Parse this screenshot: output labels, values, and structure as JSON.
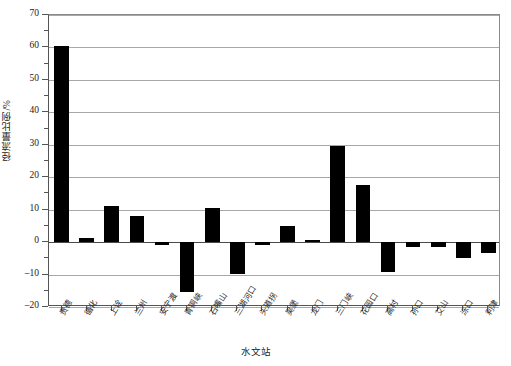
{
  "chart_data": {
    "type": "bar",
    "title": "",
    "xlabel": "水文站",
    "ylabel": "径流量比例/%",
    "ylim": [
      -20,
      70
    ],
    "ytick_step": 10,
    "yticks": [
      -20,
      -10,
      0,
      10,
      20,
      30,
      40,
      50,
      60,
      70
    ],
    "ytick_labels": [
      "-20",
      "-10",
      "0",
      "10",
      "20",
      "30",
      "40",
      "50",
      "60",
      "70"
    ],
    "grid": true,
    "grid_axis": "y",
    "legend": false,
    "bar_color": "#000000",
    "categories": [
      "贵德",
      "循化",
      "上诠",
      "兰州",
      "安宁渡",
      "青铜峡",
      "石嘴山",
      "三湖河口",
      "头道拐",
      "吴堡",
      "龙门",
      "三门峡",
      "花园口",
      "高村",
      "孙口",
      "艾山",
      "泺口",
      "利津"
    ],
    "values": [
      60.5,
      1.3,
      11.0,
      8.0,
      -0.8,
      -15.5,
      10.5,
      -9.8,
      -0.9,
      5.0,
      0.7,
      29.5,
      17.5,
      -9.3,
      -1.6,
      -1.4,
      -5.0,
      -3.3
    ]
  },
  "axes": {
    "y_title": "径流量比例/%",
    "x_title": "水文站"
  }
}
